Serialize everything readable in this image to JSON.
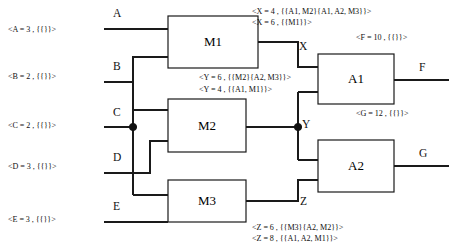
{
  "diagram": {
    "gates": [
      {
        "id": "M1",
        "label": "M1",
        "x": 168,
        "y": 16,
        "w": 90,
        "h": 52
      },
      {
        "id": "M2",
        "label": "M2",
        "x": 168,
        "y": 99,
        "w": 78,
        "h": 53
      },
      {
        "id": "M3",
        "label": "M3",
        "x": 168,
        "y": 180,
        "w": 78,
        "h": 42
      },
      {
        "id": "A1",
        "label": "A1",
        "x": 318,
        "y": 54,
        "w": 76,
        "h": 50
      },
      {
        "id": "A2",
        "label": "A2",
        "x": 318,
        "y": 140,
        "w": 76,
        "h": 52
      }
    ],
    "input_ports": [
      {
        "id": "A",
        "label": "A",
        "x": 113,
        "y": 8
      },
      {
        "id": "B",
        "label": "B",
        "x": 113,
        "y": 61
      },
      {
        "id": "C",
        "label": "C",
        "x": 113,
        "y": 107
      },
      {
        "id": "D",
        "label": "D",
        "x": 113,
        "y": 152
      },
      {
        "id": "E",
        "label": "E",
        "x": 113,
        "y": 201
      }
    ],
    "internal_ports": [
      {
        "id": "X",
        "label": "X",
        "x": 299,
        "y": 41
      },
      {
        "id": "Y",
        "label": "Y",
        "x": 302,
        "y": 119
      },
      {
        "id": "Z",
        "label": "Z",
        "x": 300,
        "y": 196
      }
    ],
    "output_ports": [
      {
        "id": "F",
        "label": "F",
        "x": 419,
        "y": 62
      },
      {
        "id": "G",
        "label": "G",
        "x": 419,
        "y": 148
      }
    ],
    "annotations": {
      "inputs": [
        {
          "id": "A",
          "text": "<A = 3 , {{}}>",
          "x": 8,
          "y": 26
        },
        {
          "id": "B",
          "text": "<B = 2 , {{}}>",
          "x": 8,
          "y": 73
        },
        {
          "id": "C",
          "text": "<C = 2 , {{}}>",
          "x": 8,
          "y": 122
        },
        {
          "id": "D",
          "text": "<D = 3 , {{}}>",
          "x": 8,
          "y": 163
        },
        {
          "id": "E",
          "text": "<E = 3 , {{}}>",
          "x": 8,
          "y": 216
        }
      ],
      "internal": [
        {
          "id": "X1",
          "text": "<X = 4 , {{A1, M2}{A1, A2, M3}}>",
          "x": 252,
          "y": 8
        },
        {
          "id": "X2",
          "text": "<X = 6 , {{M1}}>",
          "x": 252,
          "y": 19
        },
        {
          "id": "Y1",
          "text": "<Y = 6 , {{M2}{A2, M3}}>",
          "x": 199,
          "y": 74
        },
        {
          "id": "Y2",
          "text": "<Y = 4 , {{A1, M1}}>",
          "x": 199,
          "y": 86
        },
        {
          "id": "Z1",
          "text": "<Z = 6 , {{M3}{A2, M2}}>",
          "x": 252,
          "y": 224
        },
        {
          "id": "Z2",
          "text": "<Z = 8 , {{A1, A2, M1}}>",
          "x": 252,
          "y": 235
        }
      ],
      "outputs": [
        {
          "id": "F",
          "text": "<F = 10 , {{}}>",
          "x": 356,
          "y": 34
        },
        {
          "id": "G",
          "text": "<G = 12 , {{}}>",
          "x": 356,
          "y": 110
        }
      ]
    },
    "junctions": [
      {
        "id": "c-fanout",
        "cx": 133,
        "cy": 127,
        "r": 3.6
      },
      {
        "id": "y-fanout",
        "cx": 298,
        "cy": 127,
        "r": 3.6
      }
    ]
  }
}
